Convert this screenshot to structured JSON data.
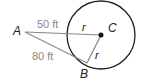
{
  "diagram": {
    "points": {
      "A": {
        "label": "A",
        "x": 25,
        "y": 32
      },
      "B": {
        "label": "B",
        "x": 87,
        "y": 63
      },
      "C": {
        "label": "C",
        "x": 101,
        "y": 35
      }
    },
    "circle": {
      "cx": 101,
      "cy": 35,
      "r": 34,
      "stroke": "#222222"
    },
    "segments": {
      "AC_label": "50 ft",
      "AB_label": "80 ft",
      "radius_label_1": "r",
      "radius_label_2": "r"
    },
    "colors": {
      "line_gray": "#888888",
      "line_dark": "#222222"
    }
  }
}
